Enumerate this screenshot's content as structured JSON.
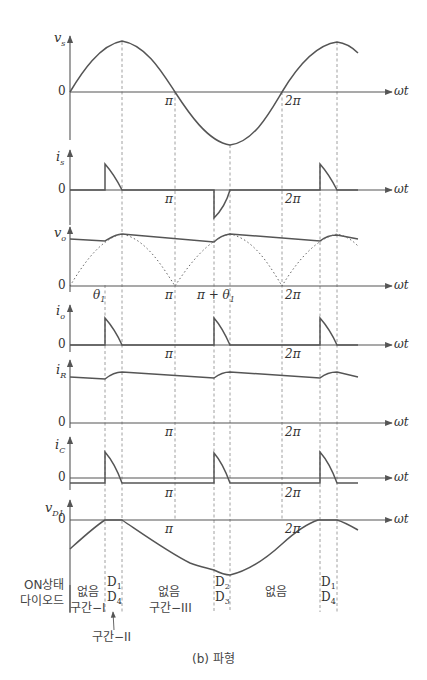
{
  "figure": {
    "caption": "(b) 파형",
    "x_axis_label": "ωt",
    "colors": {
      "curve": "#555555",
      "axis": "#555555",
      "guide": "#888888",
      "background": "#ffffff"
    }
  },
  "panels": [
    {
      "id": "vs",
      "ylabel": "v_s",
      "ylabel_main": "v",
      "ylabel_sub": "s",
      "zero_label": "0",
      "ticks": [
        "π",
        "2π"
      ]
    },
    {
      "id": "is",
      "ylabel": "i_s",
      "ylabel_main": "i",
      "ylabel_sub": "s",
      "zero_label": "0",
      "ticks": [
        "π",
        "2π"
      ]
    },
    {
      "id": "vo",
      "ylabel": "v_o",
      "ylabel_main": "v",
      "ylabel_sub": "o",
      "zero_label": "0",
      "ticks": [
        "θ1",
        "π",
        "π + θ1",
        "2π"
      ],
      "theta_main": "θ",
      "theta_sub": "1",
      "pi_plus_theta": "π + θ"
    },
    {
      "id": "io",
      "ylabel": "i_o",
      "ylabel_main": "i",
      "ylabel_sub": "o",
      "zero_label": "0",
      "ticks": [
        "π",
        "2π"
      ]
    },
    {
      "id": "iR",
      "ylabel": "i_R",
      "ylabel_main": "i",
      "ylabel_sub": "R",
      "zero_label": "0",
      "ticks": [
        "π",
        "2π"
      ]
    },
    {
      "id": "iC",
      "ylabel": "i_C",
      "ylabel_main": "i",
      "ylabel_sub": "C",
      "zero_label": "0",
      "ticks": [
        "π",
        "2π"
      ]
    },
    {
      "id": "vD1",
      "ylabel": "v_D1",
      "ylabel_main": "v",
      "ylabel_sub": "D1",
      "zero_label": "0",
      "ticks": [
        "π",
        "2π"
      ]
    }
  ],
  "tick_symbols": {
    "pi": "π",
    "two_pi": "2π"
  },
  "diode_table": {
    "row_label_line1": "ON상태",
    "row_label_line2": "다이오드",
    "cells": [
      {
        "text": "없음",
        "sub": "구간−I"
      },
      {
        "line1": "D",
        "line1_sub": "1",
        "line2": "D",
        "line2_sub": "4"
      },
      {
        "text": "없음",
        "sub": "구간−III"
      },
      {
        "line1": "D",
        "line1_sub": "2",
        "line2": "D",
        "line2_sub": "3"
      },
      {
        "text": "없음"
      },
      {
        "line1": "D",
        "line1_sub": "1",
        "line2": "D",
        "line2_sub": "4"
      }
    ],
    "interval_2_label": "구간−II"
  }
}
